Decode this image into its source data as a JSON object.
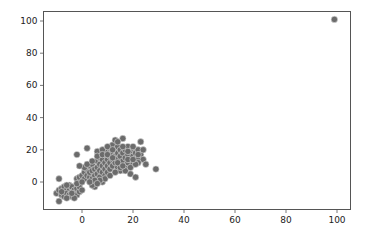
{
  "chart_data": {
    "type": "scatter",
    "title": "",
    "xlabel": "",
    "ylabel": "",
    "xlim": [
      -15,
      105
    ],
    "ylim": [
      -15,
      107
    ],
    "xticks": [
      0,
      20,
      40,
      60,
      80,
      100
    ],
    "yticks": [
      0,
      20,
      40,
      60,
      80,
      100
    ],
    "grid": false,
    "legend": null,
    "marker_color": "#6b6b6b",
    "marker_edge_color": "#d8d8d8",
    "points": [
      [
        -10,
        -7
      ],
      [
        -9,
        -5
      ],
      [
        -9,
        -12
      ],
      [
        -8,
        -4
      ],
      [
        -8,
        -8
      ],
      [
        -7,
        -6
      ],
      [
        -7,
        -3
      ],
      [
        -7,
        -9
      ],
      [
        -6,
        -5
      ],
      [
        -6,
        -7
      ],
      [
        -5,
        -4
      ],
      [
        -5,
        -8
      ],
      [
        -5,
        -2
      ],
      [
        -4,
        -6
      ],
      [
        -4,
        -9
      ],
      [
        -4,
        -3
      ],
      [
        -3,
        -5
      ],
      [
        -3,
        -7
      ],
      [
        -2,
        -4
      ],
      [
        -2,
        -8
      ],
      [
        -1,
        -6
      ],
      [
        -1,
        -3
      ],
      [
        0,
        -5
      ],
      [
        -6,
        -10
      ],
      [
        -3,
        -10
      ],
      [
        -9,
        2
      ],
      [
        -2,
        2
      ],
      [
        -1,
        3
      ],
      [
        0,
        4
      ],
      [
        1,
        2
      ],
      [
        1,
        6
      ],
      [
        2,
        4
      ],
      [
        2,
        8
      ],
      [
        3,
        3
      ],
      [
        3,
        6
      ],
      [
        3,
        10
      ],
      [
        4,
        2
      ],
      [
        4,
        7
      ],
      [
        4,
        11
      ],
      [
        5,
        4
      ],
      [
        5,
        8
      ],
      [
        5,
        -3
      ],
      [
        4,
        -2
      ],
      [
        6,
        5
      ],
      [
        6,
        9
      ],
      [
        6,
        13
      ],
      [
        7,
        3
      ],
      [
        7,
        7
      ],
      [
        7,
        11
      ],
      [
        7,
        15
      ],
      [
        8,
        6
      ],
      [
        8,
        10
      ],
      [
        8,
        14
      ],
      [
        8,
        0
      ],
      [
        9,
        4
      ],
      [
        9,
        8
      ],
      [
        9,
        12
      ],
      [
        9,
        17
      ],
      [
        10,
        6
      ],
      [
        10,
        10
      ],
      [
        10,
        14
      ],
      [
        10,
        19
      ],
      [
        11,
        8
      ],
      [
        11,
        12
      ],
      [
        11,
        16
      ],
      [
        11,
        21
      ],
      [
        12,
        10
      ],
      [
        12,
        14
      ],
      [
        12,
        18
      ],
      [
        12,
        23
      ],
      [
        13,
        12
      ],
      [
        13,
        16
      ],
      [
        13,
        20
      ],
      [
        13,
        26
      ],
      [
        14,
        9
      ],
      [
        14,
        14
      ],
      [
        14,
        18
      ],
      [
        14,
        22
      ],
      [
        15,
        11
      ],
      [
        15,
        16
      ],
      [
        15,
        20
      ],
      [
        15,
        7
      ],
      [
        16,
        13
      ],
      [
        16,
        18
      ],
      [
        16,
        27
      ],
      [
        17,
        10
      ],
      [
        17,
        15
      ],
      [
        17,
        20
      ],
      [
        18,
        12
      ],
      [
        18,
        17
      ],
      [
        18,
        22
      ],
      [
        19,
        14
      ],
      [
        19,
        19
      ],
      [
        19,
        5
      ],
      [
        20,
        11
      ],
      [
        20,
        16
      ],
      [
        20,
        21
      ],
      [
        21,
        13
      ],
      [
        21,
        18
      ],
      [
        21,
        3
      ],
      [
        22,
        15
      ],
      [
        22,
        20
      ],
      [
        23,
        17
      ],
      [
        23,
        25
      ],
      [
        24,
        14
      ],
      [
        24,
        20
      ],
      [
        25,
        11
      ],
      [
        29,
        8
      ],
      [
        -2,
        17
      ],
      [
        2,
        21
      ],
      [
        6,
        19
      ],
      [
        8,
        20
      ],
      [
        10,
        22
      ],
      [
        12,
        20
      ],
      [
        14,
        25
      ],
      [
        16,
        22
      ],
      [
        18,
        19
      ],
      [
        20,
        22
      ],
      [
        22,
        12
      ],
      [
        17,
        7
      ],
      [
        9,
        2
      ],
      [
        7,
        1
      ],
      [
        5,
        1
      ],
      [
        3,
        0
      ],
      [
        6,
        -1
      ],
      [
        11,
        4
      ],
      [
        13,
        6
      ],
      [
        15,
        9
      ],
      [
        19,
        9
      ],
      [
        21,
        11
      ],
      [
        -8,
        -6
      ],
      [
        -6,
        -2
      ],
      [
        -4,
        -7
      ],
      [
        -2,
        -1
      ],
      [
        0,
        0
      ],
      [
        1,
        9
      ],
      [
        2,
        11
      ],
      [
        -1,
        10
      ],
      [
        4,
        13
      ],
      [
        6,
        16
      ],
      [
        8,
        17
      ],
      [
        10,
        17
      ],
      [
        12,
        15
      ],
      [
        14,
        12
      ],
      [
        16,
        10
      ],
      [
        18,
        14
      ],
      [
        20,
        14
      ],
      [
        22,
        17
      ],
      [
        99,
        101
      ]
    ]
  }
}
